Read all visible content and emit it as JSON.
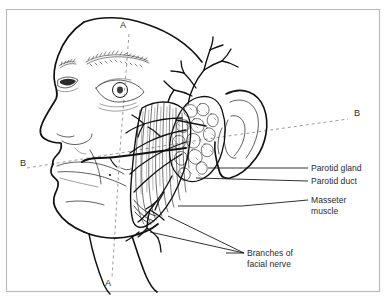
{
  "figure": {
    "kind": "anatomical-line-drawing",
    "view": "left lateral profile",
    "background_color": "#ffffff",
    "ink_color": "#111111",
    "frame_color": "#b9b9b9",
    "dash_color": "#8a8a8a",
    "text_color": "#2b2b2b"
  },
  "labels": [
    {
      "id": "parotid-gland",
      "text": "Parotid gland",
      "x": 311,
      "y": 171
    },
    {
      "id": "parotid-duct",
      "text": "Parotid duct",
      "x": 311,
      "y": 184
    },
    {
      "id": "masseter-muscle-line1",
      "text": "Masseter",
      "x": 311,
      "y": 203
    },
    {
      "id": "masseter-muscle-line2",
      "text": "muscle",
      "x": 311,
      "y": 214
    },
    {
      "id": "branches-facial-nerve-line1",
      "text": "Branches of",
      "x": 247,
      "y": 256
    },
    {
      "id": "branches-facial-nerve-line2",
      "text": "facial nerve",
      "x": 247,
      "y": 267
    }
  ],
  "section_markers": [
    {
      "id": "a-top",
      "text": "A",
      "x": 120,
      "y": 28
    },
    {
      "id": "a-bottom",
      "text": "A",
      "x": 105,
      "y": 286
    },
    {
      "id": "b-left",
      "text": "B",
      "x": 20,
      "y": 166
    },
    {
      "id": "b-right",
      "text": "B",
      "x": 354,
      "y": 116
    }
  ],
  "structures": [
    "head profile outline",
    "eyebrow",
    "eye",
    "nose",
    "lips",
    "chin",
    "neck",
    "ear",
    "parotid gland",
    "parotid duct",
    "masseter muscle",
    "branches of facial nerve"
  ]
}
